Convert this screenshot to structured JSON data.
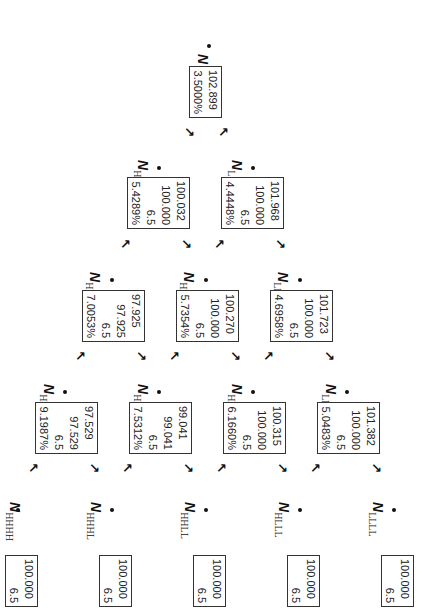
{
  "diagram": {
    "type": "binomial-interest-rate-tree",
    "orientation": "rotated-90-clockwise",
    "nodes": {
      "N": {
        "label": "N",
        "sub": "",
        "values": [
          "102.899",
          "3.5000%"
        ]
      },
      "NH": {
        "label": "N",
        "sub": "H",
        "values": [
          "100.032",
          "100.000",
          "6.5",
          "5.4289%"
        ]
      },
      "NL": {
        "label": "N",
        "sub": "L",
        "values": [
          "101.968",
          "100.000",
          "6.5",
          "4.4448%"
        ]
      },
      "NHH": {
        "label": "N",
        "sub": "HH",
        "values": [
          "97.925",
          "97.925",
          "6.5",
          "7.0053%"
        ]
      },
      "NHL": {
        "label": "N",
        "sub": "HL",
        "values": [
          "100.270",
          "100.000",
          "6.5",
          "5.7354%"
        ]
      },
      "NLL": {
        "label": "N",
        "sub": "LL",
        "values": [
          "101.723",
          "100.000",
          "6.5",
          "4.6958%"
        ]
      },
      "NHHH": {
        "label": "N",
        "sub": "HHH",
        "values": [
          "97.529",
          "97.529",
          "6.5",
          "9.1987%"
        ]
      },
      "NHHL": {
        "label": "N",
        "sub": "HHL",
        "values": [
          "99.041",
          "99.041",
          "6.5",
          "7.5312%"
        ]
      },
      "NHLL": {
        "label": "N",
        "sub": "HLL",
        "values": [
          "100.315",
          "100.000",
          "6.5",
          "6.1660%"
        ]
      },
      "NLLL": {
        "label": "N",
        "sub": "LLL",
        "values": [
          "101.382",
          "100.000",
          "6.5",
          "5.0483%"
        ]
      },
      "NHHHH": {
        "label": "N",
        "sub": "HHHH",
        "values": [
          "100.000",
          "6.5"
        ]
      },
      "NHHHL": {
        "label": "N",
        "sub": "HHHL",
        "values": [
          "100.000",
          "6.5"
        ]
      },
      "NHHLL": {
        "label": "N",
        "sub": "HHLL",
        "values": [
          "100.000",
          "6.5"
        ]
      },
      "NHLLL": {
        "label": "N",
        "sub": "HLLL",
        "values": [
          "100.000",
          "6.5"
        ]
      },
      "NLLLL": {
        "label": "N",
        "sub": "LLLL",
        "values": [
          "100.000",
          "6.5"
        ]
      }
    },
    "arrows": {
      "up": "↖",
      "down": "↗"
    }
  }
}
